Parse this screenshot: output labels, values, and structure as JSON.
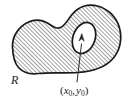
{
  "figure": {
    "type": "math-region-diagram",
    "background_color": "#ffffff",
    "outline_color": "#1a1a1a",
    "hatch_color": "#3a3a3a",
    "hatch_angle_degrees": 45,
    "hatch_spacing_px": 2,
    "labels": {
      "region": "R",
      "point_open_paren": "(",
      "point_x_var": "x",
      "point_x_sub": "0",
      "point_comma": ",",
      "point_y_var": "y",
      "point_y_sub": "0",
      "point_close_paren": ")"
    },
    "annotations": {
      "leader_line": "leader from point label up into the hole",
      "arrowhead": "arrow pointing up into the white hole"
    },
    "geometry": {
      "outer_boundary": "closed blob, hatched interior",
      "inner_hole": "small white ellipse tilted, upper right of blob",
      "hole_center": [
        84,
        38
      ],
      "hole_rx": 11,
      "hole_ry": 16,
      "hole_rotation_degrees": 20,
      "label_anchor_point": [
        77,
        82
      ]
    }
  }
}
